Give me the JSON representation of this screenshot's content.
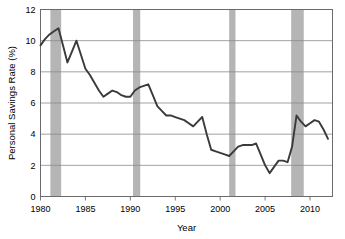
{
  "chart_data": {
    "type": "line",
    "title": "",
    "xlabel": "Year",
    "ylabel": "Personal Savings Rate (%)",
    "xlim": [
      1980,
      2012.5
    ],
    "ylim": [
      0,
      12
    ],
    "yticks": [
      0,
      2,
      4,
      6,
      8,
      10,
      12
    ],
    "ytick_labels": [
      "0",
      "2",
      "4",
      "6",
      "8",
      "10",
      "12"
    ],
    "xticks": [
      1980,
      1985,
      1990,
      1995,
      2000,
      2005,
      2010
    ],
    "xtick_labels": [
      "1980",
      "1985",
      "1990",
      "1995",
      "2000",
      "2005",
      "2010"
    ],
    "grid": "horizontal",
    "legend": "none",
    "line_color": "#3a3a3a",
    "band_color": "#b5b5b5",
    "axis_color": "#6b6b6b",
    "grid_color": "#8a8a8a",
    "x": [
      1980,
      1980.5,
      1981,
      1981.5,
      1982,
      1982.5,
      1983,
      1983.5,
      1984,
      1984.5,
      1985,
      1985.5,
      1986,
      1986.5,
      1987,
      1987.5,
      1988,
      1988.5,
      1989,
      1989.5,
      1990,
      1990.5,
      1991,
      1991.5,
      1992,
      1992.5,
      1993,
      1993.5,
      1994,
      1994.5,
      1995,
      1995.5,
      1996,
      1996.5,
      1997,
      1997.5,
      1998,
      1998.5,
      1999,
      1999.5,
      2000,
      2000.5,
      2001,
      2001.5,
      2002,
      2002.5,
      2003,
      2003.5,
      2004,
      2004.5,
      2005,
      2005.5,
      2006,
      2006.5,
      2007,
      2007.5,
      2008,
      2008.5,
      2009,
      2009.5,
      2010,
      2010.5,
      2011,
      2011.5,
      2012
    ],
    "y": [
      9.7,
      10.1,
      10.4,
      10.6,
      10.8,
      9.7,
      8.6,
      9.3,
      10.0,
      9.1,
      8.2,
      7.8,
      7.3,
      6.8,
      6.4,
      6.6,
      6.8,
      6.7,
      6.5,
      6.4,
      6.4,
      6.8,
      7.0,
      7.1,
      7.2,
      6.5,
      5.8,
      5.5,
      5.2,
      5.2,
      5.1,
      5.0,
      4.9,
      4.7,
      4.5,
      4.8,
      5.1,
      4.0,
      3.0,
      2.9,
      2.8,
      2.7,
      2.6,
      2.9,
      3.2,
      3.3,
      3.3,
      3.3,
      3.4,
      2.7,
      2.0,
      1.5,
      1.9,
      2.3,
      2.3,
      2.2,
      3.2,
      5.2,
      4.8,
      4.5,
      4.7,
      4.9,
      4.8,
      4.3,
      3.7
    ],
    "shaded_regions": [
      {
        "label": "recession-1981",
        "start": 1981.1,
        "end": 1982.3
      },
      {
        "label": "recession-1990",
        "start": 1990.3,
        "end": 1991.1
      },
      {
        "label": "recession-2001",
        "start": 2001.0,
        "end": 2001.7
      },
      {
        "label": "recession-2008",
        "start": 2007.9,
        "end": 2009.3
      }
    ]
  }
}
